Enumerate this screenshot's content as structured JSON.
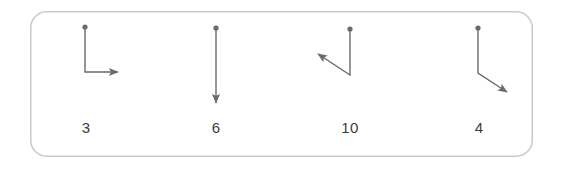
{
  "panel": {
    "background_color": "#ffffff",
    "border_color": "#c9c9c9",
    "border_width": 1.5,
    "corner_radius": 16,
    "x": 30,
    "y": 11,
    "width": 503,
    "height": 146
  },
  "style": {
    "stroke_color": "#6a6a6a",
    "stroke_width": 1.4,
    "dot_color": "#6a6a6a",
    "dot_radius": 2.6,
    "arrow_color": "#6a6a6a",
    "label_color": "#3c3c3c",
    "label_font_size": 15
  },
  "chart_data": {
    "type": "diagram",
    "title": "",
    "xlabel": "",
    "ylabel": "",
    "xlim": [
      0,
      564
    ],
    "ylim": [
      0,
      169
    ],
    "grid": false,
    "legend": false,
    "categories": [
      "3",
      "6",
      "10",
      "4"
    ],
    "values": [
      3,
      6,
      10,
      4
    ],
    "figures": [
      {
        "id": "figure-1",
        "label": "3",
        "label_x": 86,
        "label_y": 134,
        "start_dot": {
          "x": 85,
          "y": 27
        },
        "points": "85,27 85,72 118,72",
        "arrow_tip": {
          "x": 123,
          "y": 72
        },
        "arrow_angle_deg": 0,
        "segments": [
          {
            "from": [
              85,
              27
            ],
            "to": [
              85,
              72
            ],
            "direction": "down",
            "length": 45
          },
          {
            "from": [
              85,
              72
            ],
            "to": [
              123,
              72
            ],
            "direction": "right",
            "length": 38
          }
        ]
      },
      {
        "id": "figure-2",
        "label": "6",
        "label_x": 216,
        "label_y": 134,
        "start_dot": {
          "x": 216,
          "y": 28
        },
        "points": "216,28 216,103",
        "arrow_tip": {
          "x": 216,
          "y": 108
        },
        "arrow_angle_deg": 90,
        "segments": [
          {
            "from": [
              216,
              28
            ],
            "to": [
              216,
              108
            ],
            "direction": "down",
            "length": 80
          }
        ]
      },
      {
        "id": "figure-3",
        "label": "10",
        "label_x": 350,
        "label_y": 134,
        "start_dot": {
          "x": 350,
          "y": 29
        },
        "points": "350,29 350,75 318,54",
        "arrow_tip": {
          "x": 313,
          "y": 51
        },
        "arrow_angle_deg": 213,
        "segments": [
          {
            "from": [
              350,
              29
            ],
            "to": [
              350,
              75
            ],
            "direction": "down",
            "length": 46
          },
          {
            "from": [
              350,
              75
            ],
            "to": [
              313,
              51
            ],
            "direction": "up-left",
            "length": 44
          }
        ]
      },
      {
        "id": "figure-4",
        "label": "4",
        "label_x": 479,
        "label_y": 134,
        "start_dot": {
          "x": 478,
          "y": 28
        },
        "points": "478,28 478,73 507,92",
        "arrow_tip": {
          "x": 513,
          "y": 96
        },
        "arrow_angle_deg": 33,
        "segments": [
          {
            "from": [
              478,
              28
            ],
            "to": [
              478,
              73
            ],
            "direction": "down",
            "length": 45
          },
          {
            "from": [
              478,
              73
            ],
            "to": [
              513,
              96
            ],
            "direction": "down-right",
            "length": 42
          }
        ]
      }
    ]
  }
}
